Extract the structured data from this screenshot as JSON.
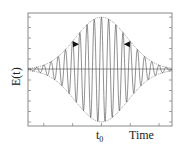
{
  "chart_data": {
    "type": "line",
    "title": "",
    "xlabel": "Time",
    "ylabel": "E(t)",
    "x_tick_labels": [
      {
        "position": "t0",
        "label": "t",
        "subscript": "0"
      }
    ],
    "grid": false,
    "legend": null,
    "series": [
      {
        "name": "E(t) carrier",
        "kind": "oscillation",
        "center": 0,
        "amplitude": 1.0,
        "sigma": 0.9,
        "period": 0.25,
        "color": "#444444"
      },
      {
        "name": "envelope",
        "kind": "gaussian",
        "center": 0,
        "amplitude": 1.0,
        "sigma": 0.9,
        "style": "dotted",
        "color": "#777777"
      }
    ],
    "annotations": [
      {
        "type": "arrow",
        "direction": "right",
        "x": -0.78,
        "y": 0.5
      },
      {
        "type": "arrow",
        "direction": "left",
        "x": 0.78,
        "y": 0.5
      }
    ],
    "xlim": [
      -2.55,
      2.45
    ],
    "ylim": [
      -1.08,
      1.08
    ],
    "x_ticks": [
      -2.0,
      -1.0,
      0.0,
      1.0,
      2.0
    ],
    "y_tick_count": 11
  },
  "labels": {
    "ylabel": "E(t)",
    "xlabel": "Time",
    "t0_main": "t",
    "t0_sub": "0"
  }
}
